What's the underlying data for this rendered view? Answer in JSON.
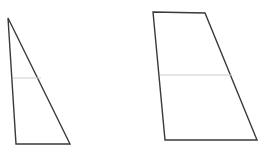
{
  "canvas": {
    "width": 269,
    "height": 156,
    "background_color": "#ffffff"
  },
  "style": {
    "outline_color": "#3a3a3a",
    "outline_width": 1.4,
    "divider_color": "#cccccc",
    "divider_width": 1,
    "fill_color": "#ffffff"
  },
  "figures": [
    {
      "id": "left-triangle",
      "name": "left-triangle",
      "type": "triangle",
      "points": "8,18 70,144 16,144",
      "vertices": [
        {
          "label": "apex",
          "x": 8,
          "y": 18
        },
        {
          "label": "bottom-right",
          "x": 70,
          "y": 144
        },
        {
          "label": "bottom-left",
          "x": 16,
          "y": 144
        }
      ],
      "divider": {
        "id": "left-triangle-divider",
        "name": "left-triangle-divider-line",
        "x1": 13,
        "y1": 78,
        "x2": 41,
        "y2": 78
      }
    },
    {
      "id": "right-quadrilateral",
      "name": "right-quadrilateral",
      "type": "quadrilateral",
      "points": "153,12 205,13 257,140 165,140",
      "vertices": [
        {
          "label": "top-left",
          "x": 153,
          "y": 12
        },
        {
          "label": "top-right",
          "x": 205,
          "y": 13
        },
        {
          "label": "bottom-right",
          "x": 257,
          "y": 140
        },
        {
          "label": "bottom-left",
          "x": 165,
          "y": 140
        }
      ],
      "divider": {
        "id": "right-quadrilateral-divider",
        "name": "right-quadrilateral-divider-line",
        "x1": 160,
        "y1": 75,
        "x2": 232,
        "y2": 75
      }
    }
  ]
}
